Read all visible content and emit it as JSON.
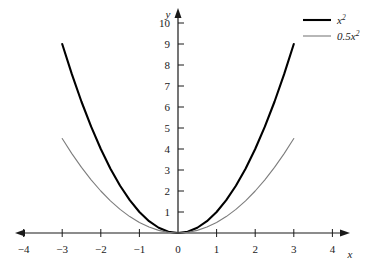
{
  "chart_data": {
    "type": "line",
    "title": "",
    "subtitle": "",
    "xlabel": "x",
    "ylabel": "y",
    "xlim": [
      -4.6,
      4.6
    ],
    "ylim": [
      -0.55,
      10.9
    ],
    "grid": false,
    "legend_position": "top-right",
    "x_ticks": [
      -4,
      -3,
      -2,
      -1,
      0,
      1,
      2,
      3,
      4
    ],
    "x_tick_labels": [
      "−4",
      "−3",
      "−2",
      "−1",
      "0",
      "1",
      "2",
      "3",
      "4"
    ],
    "y_ticks": [
      1,
      2,
      3,
      4,
      5,
      6,
      7,
      8,
      9,
      10
    ],
    "y_tick_labels": [
      "1",
      "2",
      "3",
      "4",
      "5",
      "6",
      "7",
      "8",
      "9",
      "10"
    ],
    "series": [
      {
        "name": "x²",
        "legend_base": "x",
        "legend_exp": "2",
        "color": "#000000",
        "width": 2.1,
        "domain": [
          -3,
          3
        ],
        "x": [
          -3,
          -2.75,
          -2.5,
          -2.25,
          -2,
          -1.75,
          -1.5,
          -1.25,
          -1,
          -0.75,
          -0.5,
          -0.25,
          0,
          0.25,
          0.5,
          0.75,
          1,
          1.25,
          1.5,
          1.75,
          2,
          2.25,
          2.5,
          2.75,
          3
        ],
        "values": [
          9,
          7.5625,
          6.25,
          5.0625,
          4,
          3.0625,
          2.25,
          1.5625,
          1,
          0.5625,
          0.25,
          0.0625,
          0,
          0.0625,
          0.25,
          0.5625,
          1,
          1.5625,
          2.25,
          3.0625,
          4,
          5.0625,
          6.25,
          7.5625,
          9
        ]
      },
      {
        "name": "0.5x²",
        "legend_base": "0.5x",
        "legend_exp": "2",
        "color": "#7d7d7d",
        "width": 1.1,
        "domain": [
          -3,
          3
        ],
        "x": [
          -3,
          -2.75,
          -2.5,
          -2.25,
          -2,
          -1.75,
          -1.5,
          -1.25,
          -1,
          -0.75,
          -0.5,
          -0.25,
          0,
          0.25,
          0.5,
          0.75,
          1,
          1.25,
          1.5,
          1.75,
          2,
          2.25,
          2.5,
          2.75,
          3
        ],
        "values": [
          4.5,
          3.78125,
          3.125,
          2.53125,
          2,
          1.53125,
          1.125,
          0.78125,
          0.5,
          0.28125,
          0.125,
          0.03125,
          0,
          0.03125,
          0.125,
          0.28125,
          0.5,
          0.78125,
          1.125,
          1.53125,
          2,
          2.53125,
          3.125,
          3.78125,
          4.5
        ]
      }
    ],
    "axis_color": "#1a1a1a",
    "background_color": "#ffffff"
  },
  "legend": {
    "entries": [
      {
        "label": "x²"
      },
      {
        "label": "0.5x²"
      }
    ]
  },
  "axes": {
    "x_axis_label": "x",
    "y_axis_label": "y"
  }
}
